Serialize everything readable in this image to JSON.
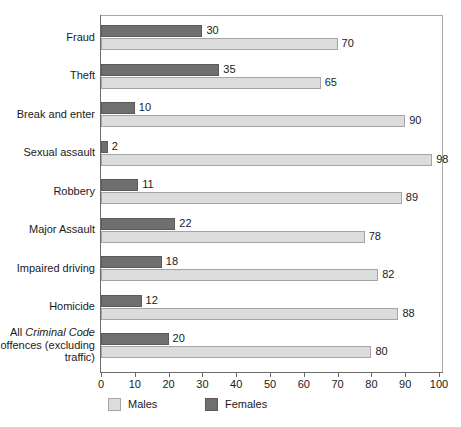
{
  "chart_data": {
    "type": "bar",
    "orientation": "horizontal",
    "title": "",
    "subtitle": "",
    "xlabel": "",
    "ylabel": "",
    "xlim": [
      0,
      100
    ],
    "xticks": [
      0,
      10,
      20,
      30,
      40,
      50,
      60,
      70,
      80,
      90,
      100
    ],
    "xtick_labels": [
      "0",
      "10",
      "20",
      "30",
      "40",
      "50",
      "60",
      "70",
      "80",
      "90",
      "100"
    ],
    "grid": false,
    "legend_position": "bottom",
    "categories": [
      "Fraud",
      "Theft",
      "Break and enter",
      "Sexual assault",
      "Robbery",
      "Major Assault",
      "Impaired driving",
      "Homicide",
      "All Criminal Code offences (excluding traffic)"
    ],
    "series": [
      {
        "name": "Females",
        "color": "#6f6f6f",
        "values": [
          30,
          35,
          10,
          2,
          11,
          22,
          18,
          12,
          20
        ]
      },
      {
        "name": "Males",
        "color": "#dcdcdc",
        "values": [
          70,
          65,
          90,
          98,
          89,
          78,
          82,
          88,
          80
        ]
      }
    ]
  },
  "categories": [
    {
      "label": "Fraud",
      "label_html": "Fraud"
    },
    {
      "label": "Theft",
      "label_html": "Theft"
    },
    {
      "label": "Break and enter",
      "label_html": "Break and enter"
    },
    {
      "label": "Sexual assault",
      "label_html": "Sexual assault"
    },
    {
      "label": "Robbery",
      "label_html": "Robbery"
    },
    {
      "label": "Major Assault",
      "label_html": "Major Assault"
    },
    {
      "label": "Impaired driving",
      "label_html": "Impaired driving"
    },
    {
      "label": "Homicide",
      "label_html": "Homicide"
    },
    {
      "label": "All Criminal Code offences (excluding traffic)",
      "label_html": "All <i>Criminal Code</i><br>offences (excluding<br>traffic)"
    }
  ],
  "values": {
    "females": [
      "30",
      "35",
      "10",
      "2",
      "11",
      "22",
      "18",
      "12",
      "20"
    ],
    "males": [
      "70",
      "65",
      "90",
      "98",
      "89",
      "78",
      "82",
      "88",
      "80"
    ]
  },
  "axis": {
    "ticks": [
      "0",
      "10",
      "20",
      "30",
      "40",
      "50",
      "60",
      "70",
      "80",
      "90",
      "100"
    ]
  },
  "legend": {
    "males_label": "Males",
    "females_label": "Females"
  },
  "colors": {
    "male_bar": "#dcdcdc",
    "female_bar": "#6f6f6f",
    "axis": "#6b6b6b",
    "frame": "#a8a8a8",
    "text": "#1a1a1a"
  }
}
